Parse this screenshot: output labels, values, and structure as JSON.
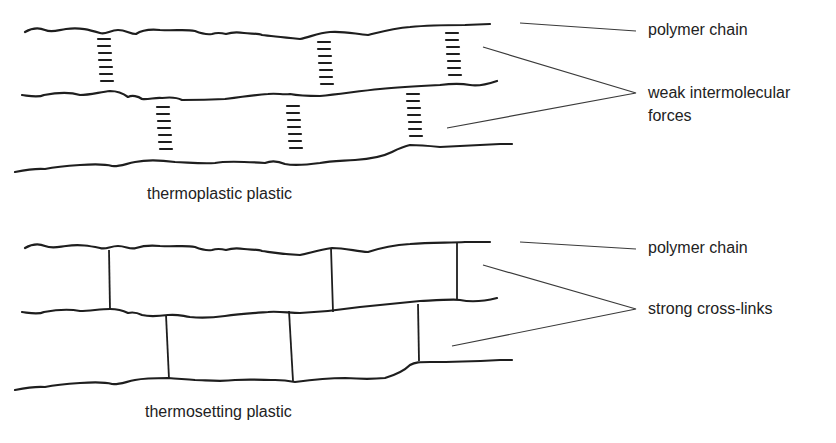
{
  "diagram": {
    "top_panel": {
      "caption": "thermoplastic plastic",
      "labels": {
        "chain": "polymer chain",
        "bond_line1": "weak intermolecular",
        "bond_line2": "forces"
      }
    },
    "bottom_panel": {
      "caption": "thermosetting plastic",
      "labels": {
        "chain": "polymer chain",
        "bond": "strong cross-links"
      }
    },
    "colors": {
      "line": "#1e1e1e",
      "text": "#222222",
      "background": "#ffffff"
    }
  }
}
